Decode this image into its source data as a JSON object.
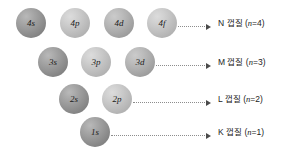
{
  "diagram": {
    "background_color": "#ffffff",
    "sphere_dark_color": "#949494",
    "sphere_light_color": "#c0c0c0",
    "leader_color": "#8d8d8d",
    "arrow_color": "#4a4a4a",
    "text_color": "#232323"
  },
  "rows": [
    {
      "shell_letter": "N",
      "shell_word": "껍질",
      "n_symbol": "n",
      "n_value": "=4",
      "label_full": "N 껍질 (n=4)",
      "orbitals": [
        {
          "label": "4s",
          "tone": "dark",
          "x": 16,
          "y": 8
        },
        {
          "label": "4p",
          "tone": "light",
          "x": 60,
          "y": 8
        },
        {
          "label": "4d",
          "tone": "mid",
          "x": 104,
          "y": 8
        },
        {
          "label": "4f",
          "tone": "light",
          "x": 147,
          "y": 8
        }
      ]
    },
    {
      "shell_letter": "M",
      "shell_word": "껍질",
      "n_symbol": "n",
      "n_value": "=3",
      "label_full": "M 껍질 (n=3)",
      "orbitals": [
        {
          "label": "3s",
          "tone": "dark",
          "x": 38,
          "y": 47
        },
        {
          "label": "3p",
          "tone": "light",
          "x": 81,
          "y": 47
        },
        {
          "label": "3d",
          "tone": "mid",
          "x": 125,
          "y": 47
        }
      ]
    },
    {
      "shell_letter": "L",
      "shell_word": "껍질",
      "n_symbol": "n",
      "n_value": "=2",
      "label_full": "L 껍질 (n=2)",
      "orbitals": [
        {
          "label": "2s",
          "tone": "dark",
          "x": 59,
          "y": 84
        },
        {
          "label": "2p",
          "tone": "light",
          "x": 102,
          "y": 84
        }
      ]
    },
    {
      "shell_letter": "K",
      "shell_word": "껍질",
      "n_symbol": "n",
      "n_value": "=1",
      "label_full": "K 껍질 (n=1)",
      "orbitals": [
        {
          "label": "1s",
          "tone": "dark",
          "x": 80,
          "y": 117
        }
      ]
    }
  ],
  "connectors": [
    {
      "x": 178,
      "y": 23,
      "width": 33
    },
    {
      "x": 156,
      "y": 62,
      "width": 55
    },
    {
      "x": 133,
      "y": 99,
      "width": 78
    },
    {
      "x": 111,
      "y": 132,
      "width": 100
    }
  ],
  "shell_label_positions": [
    {
      "x": 218,
      "y": 19
    },
    {
      "x": 218,
      "y": 58
    },
    {
      "x": 218,
      "y": 95
    },
    {
      "x": 218,
      "y": 128
    }
  ]
}
